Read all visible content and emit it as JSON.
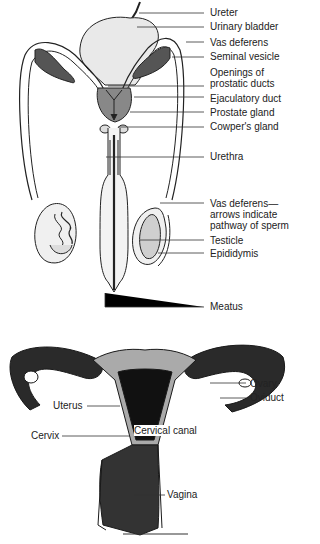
{
  "male_diagram": {
    "labels": [
      {
        "id": "ureter",
        "text": "Ureter"
      },
      {
        "id": "urinary-bladder",
        "text": "Urinary bladder"
      },
      {
        "id": "vas-deferens",
        "text": "Vas deferens"
      },
      {
        "id": "seminal-vesicle",
        "text": "Seminal vesicle"
      },
      {
        "id": "openings-prostatic-ducts",
        "text": "Openings of prostatic ducts"
      },
      {
        "id": "ejaculatory-duct",
        "text": "Ejaculatory duct"
      },
      {
        "id": "prostate-gland",
        "text": "Prostate gland"
      },
      {
        "id": "cowpers-gland",
        "text": "Cowper's gland"
      },
      {
        "id": "urethra",
        "text": "Urethra"
      },
      {
        "id": "vas-deferens-arrows",
        "text": "Vas deferens— arrows indicate pathway of sperm"
      },
      {
        "id": "testicle",
        "text": "Testicle"
      },
      {
        "id": "epididymis",
        "text": "Epididymis"
      },
      {
        "id": "meatus",
        "text": "Meatus"
      }
    ]
  },
  "female_diagram": {
    "labels": [
      {
        "id": "ovary",
        "text": "Ovary"
      },
      {
        "id": "oviduct",
        "text": "Oviduct"
      },
      {
        "id": "uterus",
        "text": "Uterus"
      },
      {
        "id": "cervix",
        "text": "Cervix"
      },
      {
        "id": "cervical-canal",
        "text": "Cervical canal"
      },
      {
        "id": "vagina",
        "text": "Vagina"
      }
    ]
  }
}
